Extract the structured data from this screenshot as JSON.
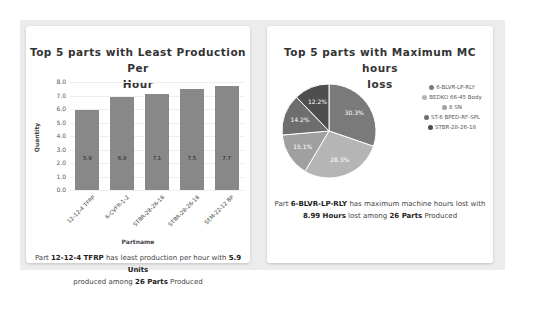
{
  "left_card": {
    "title_line1": "Top 5 parts with Least Production Per",
    "title_line2": "Hour",
    "ylabel": "Quantity",
    "xlabel": "Partname",
    "yticks": [
      "8.0",
      "7.0",
      "6.0",
      "5.0",
      "4.0",
      "3.0",
      "2.0",
      "1.0",
      "0.0"
    ],
    "bars": [
      {
        "label": "12-12-4 TFRP",
        "value": 5.9,
        "text": "5.9"
      },
      {
        "label": "6-CVFR-1-2",
        "value": 6.9,
        "text": "6.9"
      },
      {
        "label": "STBR-28-26-18",
        "value": 7.1,
        "text": "7.1"
      },
      {
        "label": "STBR-28-26-18",
        "value": 7.5,
        "text": "7.5"
      },
      {
        "label": "SEM-22-12 BP",
        "value": 7.7,
        "text": "7.7"
      }
    ],
    "desc": {
      "pre": "Part ",
      "part": "12-12-4 TFRP",
      "mid": " has least production per hour with ",
      "value": "5.9 Units",
      "mid2": " produced among ",
      "count": "26 Parts",
      "post": " Produced"
    }
  },
  "right_card": {
    "title_line1": "Top 5 parts with Maximum MC hours",
    "title_line2": "loss",
    "slices": [
      {
        "label": "6-BLVR-LP-RLY",
        "pct": "30.3%",
        "color": "#7a7a7a"
      },
      {
        "label": "BEDKO 66-45 Body",
        "pct": "28.3%",
        "color": "#b5b5b5"
      },
      {
        "label": "8 SN",
        "pct": "15.1%",
        "color": "#a0a0a0"
      },
      {
        "label": "ST-6 BPED-RF-SPL",
        "pct": "14.2%",
        "color": "#6e6e6e"
      },
      {
        "label": "STBR-28-26-18",
        "pct": "12.2%",
        "color": "#4e4e4e"
      }
    ],
    "desc": {
      "pre": "Part ",
      "part": "6-BLVR-LP-RLY",
      "mid": " has maximum machine hours lost with ",
      "value": "8.99 Hours",
      "mid2": " lost among ",
      "count": "26 Parts",
      "post": " Produced"
    }
  },
  "chart_data": [
    {
      "type": "bar",
      "title": "Top 5 parts with Least Production Per Hour",
      "categories": [
        "12-12-4 TFRP",
        "6-CVFR-1-2",
        "STBR-28-26-18",
        "STBR-28-26-18",
        "SEM-22-12 BP"
      ],
      "values": [
        5.9,
        6.9,
        7.1,
        7.5,
        7.7
      ],
      "xlabel": "Partname",
      "ylabel": "Quantity",
      "ylim": [
        0,
        8
      ],
      "grid": true,
      "legend": "none"
    },
    {
      "type": "pie",
      "title": "Top 5 parts with Maximum MC hours loss",
      "categories": [
        "6-BLVR-LP-RLY",
        "BEDKO 66-45 Body",
        "8 SN",
        "ST-6 BPED-RF-SPL",
        "STBR-28-26-18"
      ],
      "values": [
        30.3,
        28.3,
        15.1,
        14.2,
        12.2
      ],
      "legend_position": "right"
    }
  ]
}
